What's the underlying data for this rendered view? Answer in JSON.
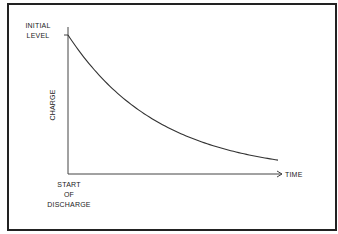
{
  "diagram": {
    "type": "exponential-decay",
    "labels": {
      "y_top_line1": "INITIAL",
      "y_top_line2": "LEVEL",
      "y_axis": "CHARGE",
      "x_axis": "TIME",
      "x_origin_line1": "START",
      "x_origin_line2": "OF",
      "x_origin_line3": "DISCHARGE"
    },
    "curve": {
      "initial_value": 1.0,
      "final_value_fraction": 0.1,
      "description": "Charge decays exponentially from initial level over time"
    },
    "colors": {
      "line": "#333333",
      "frame": "#222222"
    }
  }
}
